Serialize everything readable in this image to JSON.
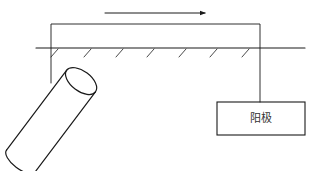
{
  "diagram": {
    "type": "cathodic-protection-schematic",
    "anode_label": "阳极",
    "current_direction": "left-to-right",
    "colors": {
      "line": "#1a1a1a",
      "text": "#333333",
      "background": "#ffffff"
    },
    "elements": [
      {
        "name": "current-arrow",
        "description": "Arrow above the circuit showing current direction"
      },
      {
        "name": "connecting-wire",
        "description": "Wire linking the buried pipe to the anode"
      },
      {
        "name": "ground-surface",
        "description": "Ground line with hatch marks"
      },
      {
        "name": "buried-pipe",
        "description": "Cylindrical pipe shown diagonally below ground"
      },
      {
        "name": "anode-box",
        "description": "Rectangular box labeled anode"
      }
    ]
  }
}
